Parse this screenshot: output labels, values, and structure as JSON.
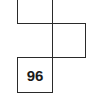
{
  "diagram": {
    "type": "grid-net",
    "cells": [
      {
        "id": "top",
        "label": ""
      },
      {
        "id": "right",
        "label": ""
      },
      {
        "id": "bottom",
        "label": "96"
      }
    ],
    "line_color": "#2a2a2a",
    "background": "#ffffff"
  }
}
